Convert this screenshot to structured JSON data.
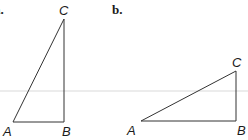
{
  "panels": [
    {
      "label": "a.",
      "vertices": {
        "A": {
          "label": "A",
          "x": 13,
          "y": 122
        },
        "B": {
          "label": "B",
          "x": 64,
          "y": 122
        },
        "C": {
          "label": "C",
          "x": 64,
          "y": 19
        }
      },
      "right_angle_at": "B"
    },
    {
      "label": "b.",
      "vertices": {
        "A": {
          "label": "A",
          "x": 141,
          "y": 121
        },
        "B": {
          "label": "B",
          "x": 236,
          "y": 121
        },
        "C": {
          "label": "C",
          "x": 236,
          "y": 71
        }
      },
      "right_angle_at": "B"
    }
  ],
  "colors": {
    "line": "#333333",
    "text": "#1a1a1a",
    "background": "#ffffff"
  }
}
